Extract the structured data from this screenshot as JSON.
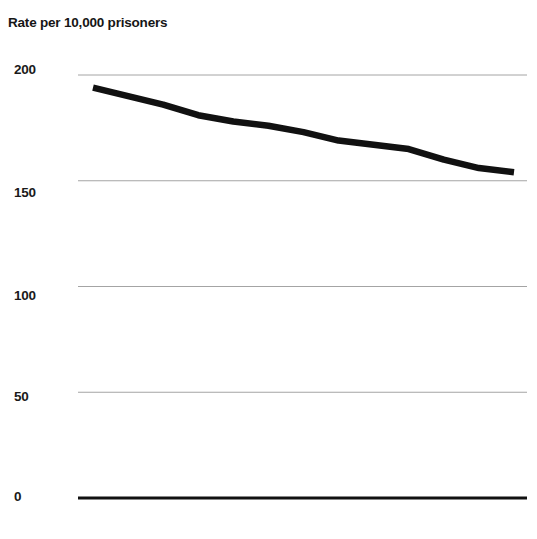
{
  "chart_data": {
    "type": "line",
    "title": "Rate per 10,000 prisoners",
    "xlabel": "",
    "ylabel": "Rate per 10,000 prisoners",
    "ylim": [
      0,
      200
    ],
    "xlim": [
      0,
      12
    ],
    "grid": true,
    "legend": null,
    "yticks": [
      {
        "value": 200,
        "label": "200"
      },
      {
        "value": 150,
        "label": "150"
      },
      {
        "value": 100,
        "label": "100"
      },
      {
        "value": 50,
        "label": "50"
      },
      {
        "value": 0,
        "label": "0"
      }
    ],
    "xticks": [],
    "series": [
      {
        "name": "Rate per 10,000 prisoners",
        "color": "#111111",
        "x": [
          0,
          1,
          2,
          3,
          4,
          5,
          6,
          7,
          8,
          9,
          10,
          11,
          12
        ],
        "values": [
          194,
          190,
          186,
          181,
          178,
          176,
          173,
          169,
          167,
          165,
          160,
          156,
          154
        ]
      }
    ]
  },
  "axis": {
    "baseline_value": 0,
    "baseline_color": "#111111",
    "gridline_color": "#9a9a9a"
  }
}
